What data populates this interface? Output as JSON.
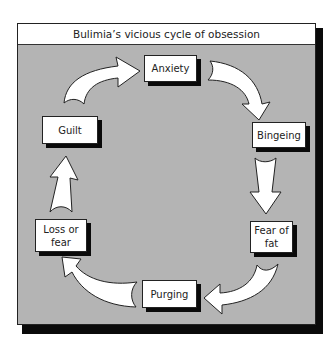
{
  "title": "Bulimia’s vicious cycle of obsession",
  "colors": {
    "background_panel": "#b4b4b4",
    "box_fill": "#ffffff",
    "shadow": "#0a0a0a",
    "text": "#222222"
  },
  "nodes": [
    {
      "id": "anxiety",
      "label": "Anxiety"
    },
    {
      "id": "bingeing",
      "label": "Bingeing"
    },
    {
      "id": "fear-of-fat",
      "label": "Fear of\nfat"
    },
    {
      "id": "purging",
      "label": "Purging"
    },
    {
      "id": "loss-or-fear",
      "label": "Loss or\nfear"
    },
    {
      "id": "guilt",
      "label": "Guilt"
    }
  ],
  "edges": [
    {
      "from": "anxiety",
      "to": "bingeing"
    },
    {
      "from": "bingeing",
      "to": "fear-of-fat"
    },
    {
      "from": "fear-of-fat",
      "to": "purging"
    },
    {
      "from": "purging",
      "to": "loss-or-fear"
    },
    {
      "from": "loss-or-fear",
      "to": "guilt"
    },
    {
      "from": "guilt",
      "to": "anxiety"
    }
  ]
}
